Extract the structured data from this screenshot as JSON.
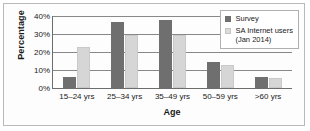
{
  "chart_data": {
    "type": "bar",
    "title": "",
    "xlabel": "Age",
    "ylabel": "Percentage",
    "categories": [
      "15–24 yrs",
      "25–34 yrs",
      "35–49 yrs",
      "50–59 yrs",
      ">60 yrs"
    ],
    "series": [
      {
        "name": "Survey",
        "values": [
          6,
          36.5,
          38,
          14.5,
          6
        ],
        "color": "#6f6f6f"
      },
      {
        "name": "SA Internet users (Jan 2014)",
        "values": [
          23,
          29.5,
          29.5,
          13,
          5.5
        ],
        "color": "#d6d6d6"
      }
    ],
    "ylim": [
      0,
      40
    ],
    "yticks": [
      0,
      10,
      20,
      30,
      40
    ],
    "ytick_labels": [
      "0%",
      "10%",
      "20%",
      "30%",
      "40%"
    ],
    "grid": "horizontal",
    "legend_position": "top-right",
    "legend": [
      {
        "label": "Survey"
      },
      {
        "label": "SA Internet users\n(Jan 2014)"
      }
    ]
  }
}
